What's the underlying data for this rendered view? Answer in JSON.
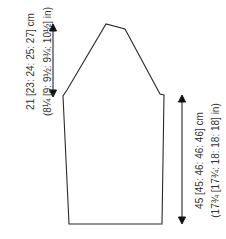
{
  "diagram": {
    "line_color": "#2a2a2a",
    "label_color": "#333333",
    "shape_points": "69,224 162,224 164,95 160,94 125,29 106,24 67,90 63,96",
    "dimensions": {
      "cap_height": {
        "metric": "21 [23: 24: 25: 27] cm",
        "imperial": "(8¼ [9: 9½: 9¾: 10½] in)"
      },
      "sleeve_length": {
        "metric": "45 [45: 46: 46: 46] cm",
        "imperial": "(17¾ [17¾: 18: 18: 18] in)"
      }
    }
  }
}
